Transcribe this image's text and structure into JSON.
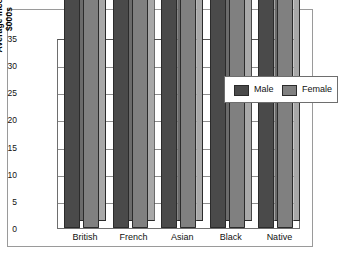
{
  "chart_data": {
    "type": "bar",
    "title": "",
    "xlabel": "",
    "ylabel": "Average Income\n$000s",
    "ylabel_line1": "Average Income",
    "ylabel_line2": "$000s",
    "ylim": [
      0,
      35
    ],
    "yticks": [
      "0",
      "5",
      "10",
      "15",
      "20",
      "25",
      "30",
      "35"
    ],
    "grid": true,
    "legend_position": "top-right",
    "categories": [
      "British",
      "French",
      "Asian",
      "Black",
      "Native"
    ],
    "series": [
      {
        "name": "Male",
        "color": "#4a4a4a",
        "values": [
          30019,
          26547,
          22979,
          20592,
          14207
        ],
        "labels": [
          "30 019",
          "26 547",
          "22 979",
          "20 592",
          "14 207"
        ]
      },
      {
        "name": "Female",
        "color": "#808080",
        "values": [
          15772,
          13958,
          13657,
          14717,
          9344
        ],
        "labels": [
          "15 772",
          "13 958",
          "13 657",
          "14 717",
          "9344"
        ]
      }
    ]
  },
  "legend": {
    "male_label": "Male",
    "female_label": "Female"
  }
}
